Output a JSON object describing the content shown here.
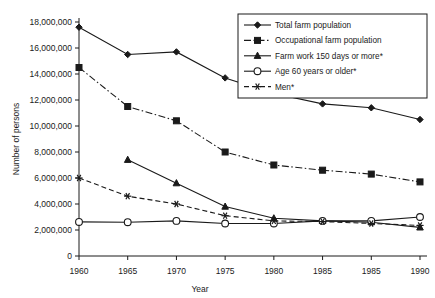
{
  "chart_data": {
    "type": "line",
    "title": "",
    "xlabel": "Year",
    "ylabel": "Number of persons",
    "x": [
      1960,
      1965,
      1970,
      1975,
      1980,
      1985,
      1985,
      1990
    ],
    "xtick_labels": [
      "1960",
      "1965",
      "1970",
      "1975",
      "1980",
      "1985",
      "1985",
      "1990"
    ],
    "ytick_labels": [
      "0",
      "2,000,000",
      "4,000,000",
      "6,000,000",
      "8,000,000",
      "10,000,000",
      "12,000,000",
      "14,000,000",
      "16,000,000",
      "18,000,000"
    ],
    "ytick_values": [
      0,
      2000000,
      4000000,
      6000000,
      8000000,
      10000000,
      12000000,
      14000000,
      16000000,
      18000000
    ],
    "ylim": [
      0,
      18000000
    ],
    "grid": false,
    "legend_position": "top-right",
    "series": [
      {
        "name": "Total farm population",
        "marker": "diamond",
        "dash": "solid",
        "values": [
          17600000,
          15500000,
          15700000,
          13700000,
          12500000,
          11700000,
          11400000,
          10500000
        ]
      },
      {
        "name": "Occupational farm population",
        "marker": "square",
        "dash": "dashdot",
        "values": [
          14500000,
          11500000,
          10400000,
          8000000,
          7000000,
          6600000,
          6300000,
          5700000
        ]
      },
      {
        "name": "Farm work 150 days or more*",
        "marker": "triangle",
        "dash": "solid",
        "values": [
          null,
          7400000,
          5600000,
          3800000,
          2900000,
          2700000,
          2600000,
          2200000
        ]
      },
      {
        "name": "Age 60 years or older*",
        "marker": "circle-open",
        "dash": "solid",
        "values": [
          2620000,
          2600000,
          2700000,
          2500000,
          2500000,
          2700000,
          2700000,
          3000000
        ]
      },
      {
        "name": "Men*",
        "marker": "asterisk",
        "dash": "dashed",
        "values": [
          6000000,
          4600000,
          4000000,
          3100000,
          2700000,
          2650000,
          2500000,
          2350000
        ]
      }
    ]
  }
}
